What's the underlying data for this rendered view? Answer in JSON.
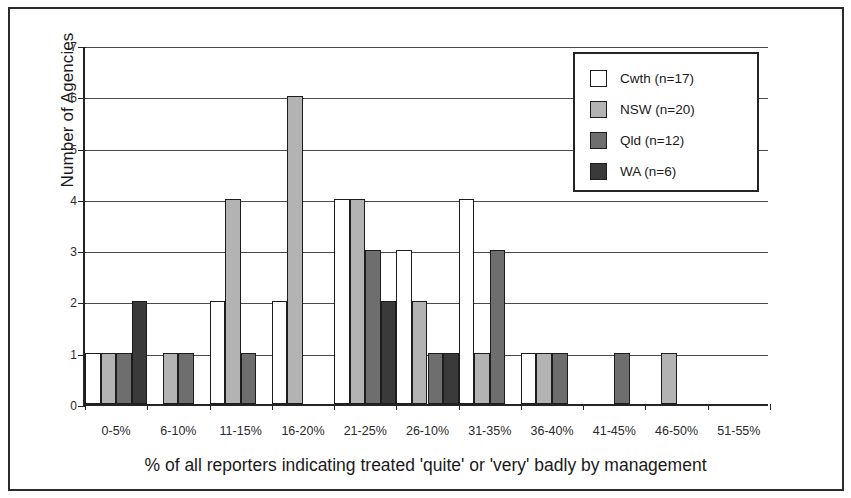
{
  "chart_data": {
    "type": "bar",
    "title": "",
    "xlabel": "% of all reporters indicating treated 'quite' or 'very' badly by management",
    "ylabel": "Number of Agencies",
    "categories": [
      "0-5%",
      "6-10%",
      "11-15%",
      "16-20%",
      "21-25%",
      "26-10%",
      "31-35%",
      "36-40%",
      "41-45%",
      "46-50%",
      "51-55%"
    ],
    "ylim": [
      0,
      7
    ],
    "yticks": [
      0,
      1,
      2,
      3,
      4,
      5,
      6,
      7
    ],
    "grid": true,
    "legend_position": "top-right",
    "series": [
      {
        "name": "Cwth",
        "label": "Cwth (n=17)",
        "n": 17,
        "color": "#ffffff",
        "values": [
          1,
          0,
          2,
          2,
          4,
          3,
          4,
          1,
          0,
          0,
          0
        ]
      },
      {
        "name": "NSW",
        "label": "NSW (n=20)",
        "n": 20,
        "color": "#b3b3b3",
        "values": [
          1,
          1,
          4,
          6,
          4,
          2,
          1,
          1,
          0,
          1,
          0
        ]
      },
      {
        "name": "Qld",
        "label": "Qld (n=12)",
        "n": 12,
        "color": "#6e6e6e",
        "values": [
          1,
          1,
          1,
          0,
          3,
          1,
          3,
          1,
          1,
          0,
          0
        ]
      },
      {
        "name": "WA",
        "label": "WA (n=6)",
        "n": 6,
        "color": "#3a3a3a",
        "values": [
          2,
          0,
          0,
          0,
          2,
          1,
          0,
          0,
          0,
          0,
          0
        ]
      }
    ]
  },
  "legend": {
    "items": [
      {
        "label": "Cwth (n=17)",
        "color": "#ffffff"
      },
      {
        "label": "NSW (n=20)",
        "color": "#b3b3b3"
      },
      {
        "label": "Qld (n=12)",
        "color": "#6e6e6e"
      },
      {
        "label": "WA (n=6)",
        "color": "#3a3a3a"
      }
    ]
  },
  "axes": {
    "y_title": "Number of Agencies",
    "x_title": "% of all reporters indicating treated 'quite' or 'very' badly by management",
    "y_tick_labels": [
      "0",
      "1",
      "2",
      "3",
      "4",
      "5",
      "6",
      "7"
    ],
    "x_tick_labels": [
      "0-5%",
      "6-10%",
      "11-15%",
      "16-20%",
      "21-25%",
      "26-10%",
      "31-35%",
      "36-40%",
      "41-45%",
      "46-50%",
      "51-55%"
    ]
  }
}
